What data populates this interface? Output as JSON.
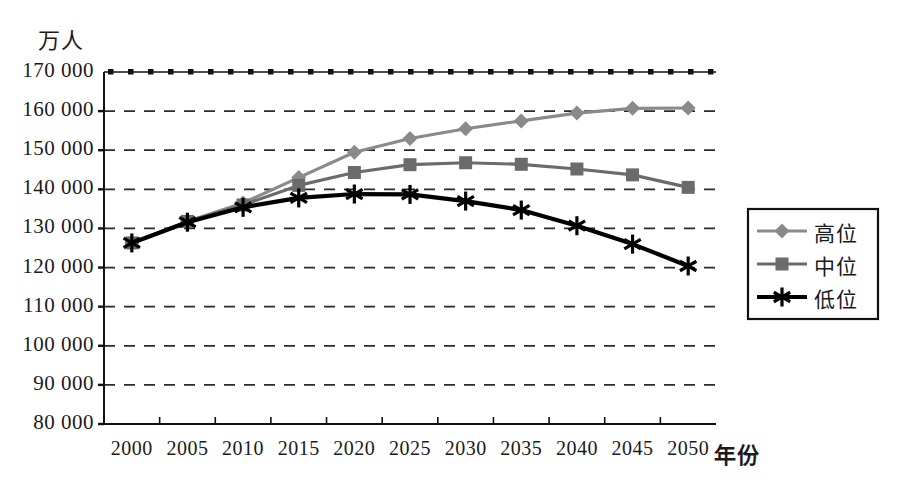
{
  "chart_data": {
    "type": "line",
    "title": "",
    "xlabel": "年份",
    "ylabel": "万人",
    "categories": [
      "2000",
      "2005",
      "2010",
      "2015",
      "2020",
      "2025",
      "2030",
      "2035",
      "2040",
      "2045",
      "2050"
    ],
    "x": [
      2000,
      2005,
      2010,
      2015,
      2020,
      2025,
      2030,
      2035,
      2040,
      2045,
      2050
    ],
    "series": [
      {
        "name": "高位",
        "marker": "diamond",
        "color": "#8a8a8a",
        "values": [
          126300,
          131800,
          136500,
          143000,
          149500,
          153000,
          155500,
          157500,
          159500,
          160700,
          160800
        ]
      },
      {
        "name": "中位",
        "marker": "square",
        "color": "#6b6b6b",
        "values": [
          126300,
          131800,
          136000,
          141000,
          144300,
          146300,
          146800,
          146400,
          145200,
          143700,
          140500
        ]
      },
      {
        "name": "低位",
        "marker": "asterisk",
        "color": "#000000",
        "values": [
          126300,
          131600,
          135400,
          137800,
          138800,
          138700,
          137000,
          134700,
          130700,
          126000,
          120400
        ]
      }
    ],
    "ylim": [
      80000,
      170000
    ],
    "ytick_step": 10000,
    "ytick_labels": [
      "170 000",
      "160 000",
      "150 000",
      "140 000",
      "130 000",
      "120 000",
      "110 000",
      "100 000",
      "90 000",
      "80 000"
    ],
    "ytick_values": [
      170000,
      160000,
      150000,
      140000,
      130000,
      120000,
      110000,
      100000,
      90000,
      80000
    ],
    "grid": true,
    "grid_style": "dashed",
    "legend_position": "right"
  },
  "legend": {
    "entries": [
      {
        "label": "高位",
        "marker": "diamond-icon",
        "color": "#8a8a8a"
      },
      {
        "label": "中位",
        "marker": "square-icon",
        "color": "#6b6b6b"
      },
      {
        "label": "低位",
        "marker": "asterisk-icon",
        "color": "#000000"
      }
    ]
  },
  "axes": {
    "y_unit_label": "万人",
    "x_title": "年份"
  }
}
